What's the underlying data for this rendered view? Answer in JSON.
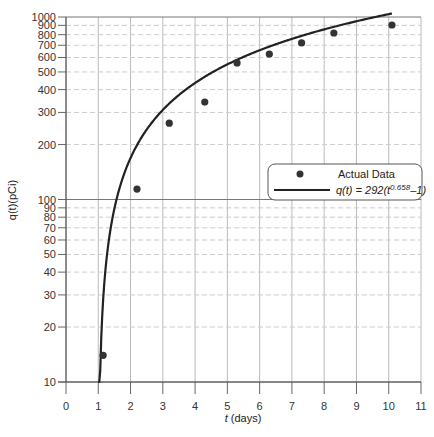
{
  "chart_data": {
    "type": "scatter",
    "title": "",
    "xlabel": "t (days)",
    "ylabel": "q(t)(pCi)",
    "xlim": [
      0,
      11
    ],
    "ylim": [
      10,
      1000
    ],
    "yscale": "log",
    "grid": true,
    "x_ticks": [
      0,
      1,
      2,
      3,
      4,
      5,
      6,
      7,
      8,
      9,
      10,
      11
    ],
    "y_ticks": [
      10,
      20,
      30,
      40,
      50,
      60,
      70,
      80,
      90,
      100,
      200,
      300,
      400,
      500,
      600,
      700,
      800,
      900,
      1000
    ],
    "series": [
      {
        "name": "Actual Data",
        "type": "scatter",
        "x": [
          1.15,
          2.2,
          3.2,
          4.3,
          5.3,
          6.3,
          7.3,
          8.3,
          10.1
        ],
        "y": [
          14,
          114,
          262,
          342,
          560,
          627,
          721,
          817,
          904
        ]
      },
      {
        "name": "q(t) = 292(t^0.658 - 1)",
        "type": "line",
        "formula": {
          "a": 292,
          "b": 0.658
        },
        "x_range": [
          1.0,
          10.1
        ]
      }
    ],
    "legend": {
      "position": "right-middle",
      "entries": [
        "Actual Data",
        "q(t) = 292(t^0.658 - 1)"
      ]
    }
  },
  "legend": {
    "data_label": "Actual Data",
    "fit_prefix": "q(t) = 292(t",
    "fit_exp": "0.658",
    "fit_suffix": "–1)"
  },
  "axes": {
    "xlabel_var": "t",
    "xlabel_unit": " (days)",
    "ylabel": "q(t)(pCi)"
  }
}
